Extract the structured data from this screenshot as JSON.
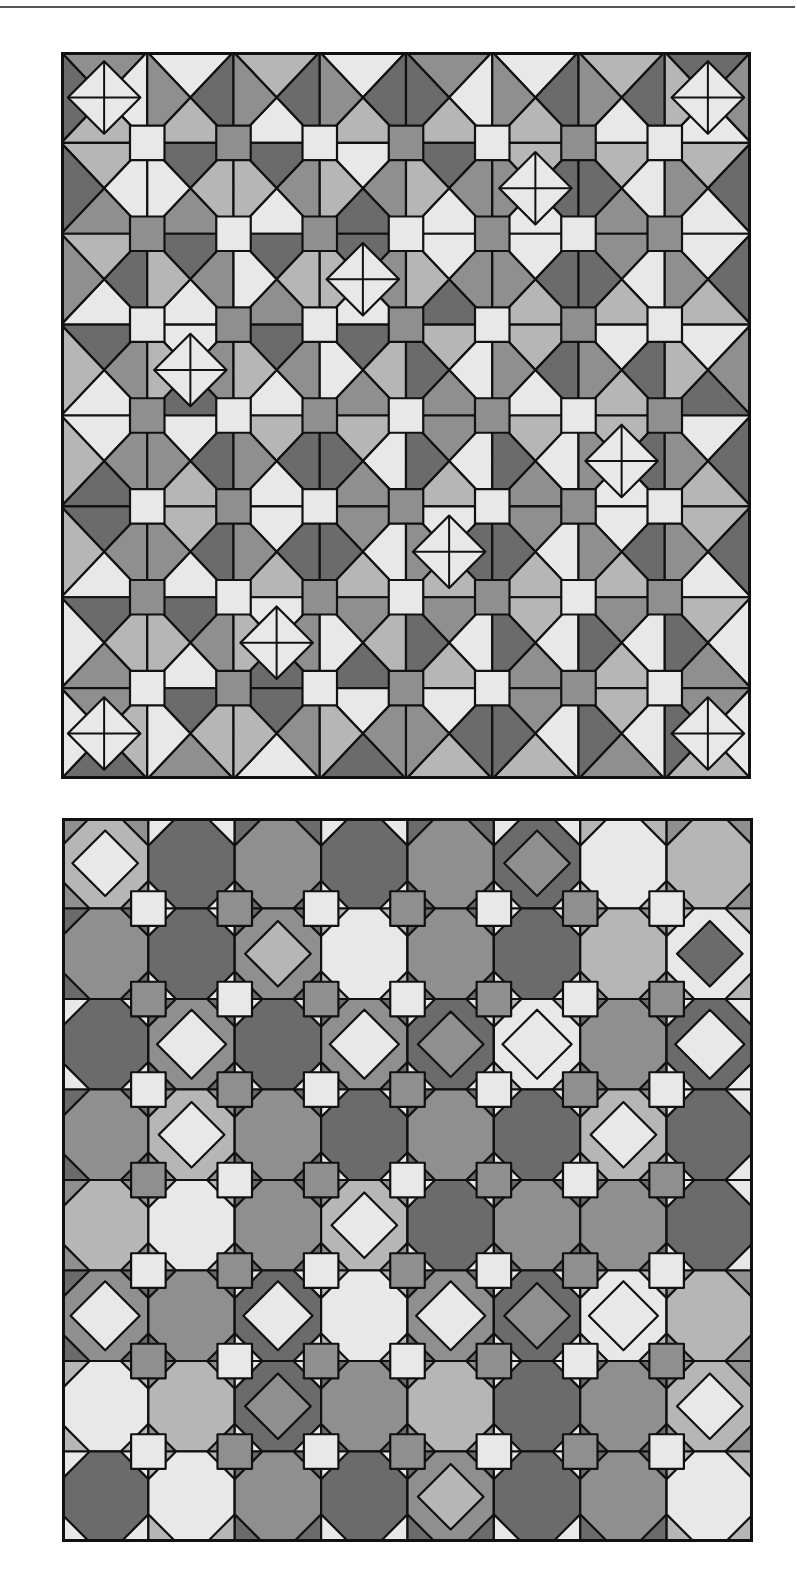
{
  "page": {
    "header_rule": true
  },
  "palette": {
    "light": "#e8e8e8",
    "midlight": "#b6b6b6",
    "mid": "#8f8f8f",
    "dark": "#6b6b6b",
    "line": "#111111"
  },
  "figures": [
    {
      "id": "top",
      "description": "Star-and-kite tessellation, 8 by 8 grid with small squares at cell corners",
      "cols": 8,
      "rows": 8,
      "motif": "star",
      "tones": [
        [
          "mid",
          "dark",
          "midlight",
          "dark",
          "mid",
          "dark",
          "midlight",
          "mid"
        ],
        [
          "light",
          "dark",
          "mid",
          "light",
          "mid",
          "midlight",
          "light",
          "midlight"
        ],
        [
          "midlight",
          "mid",
          "dark",
          "mid",
          "light",
          "dark",
          "mid",
          "dark"
        ],
        [
          "mid",
          "light",
          "mid",
          "dark",
          "light",
          "midlight",
          "dark",
          "light"
        ],
        [
          "light",
          "dark",
          "midlight",
          "light",
          "mid",
          "light",
          "midlight",
          "dark"
        ],
        [
          "mid",
          "midlight",
          "dark",
          "mid",
          "dark",
          "mid",
          "dark",
          "midlight"
        ],
        [
          "dark",
          "mid",
          "light",
          "midlight",
          "mid",
          "light",
          "mid",
          "light"
        ],
        [
          "midlight",
          "dark",
          "mid",
          "light",
          "dark",
          "mid",
          "light",
          "mid"
        ]
      ]
    },
    {
      "id": "bottom",
      "description": "Interlocking hexagon-and-diamond tessellation, 8 by 8 grid with small squares at cell corners",
      "cols": 8,
      "rows": 8,
      "motif": "hex",
      "tones": [
        [
          "midlight",
          "dark",
          "mid",
          "dark",
          "mid",
          "dark",
          "light",
          "midlight"
        ],
        [
          "mid",
          "dark",
          "mid",
          "light",
          "mid",
          "dark",
          "midlight",
          "light"
        ],
        [
          "dark",
          "mid",
          "dark",
          "mid",
          "dark",
          "light",
          "mid",
          "dark"
        ],
        [
          "mid",
          "midlight",
          "mid",
          "dark",
          "mid",
          "dark",
          "midlight",
          "dark"
        ],
        [
          "midlight",
          "light",
          "mid",
          "midlight",
          "dark",
          "mid",
          "mid",
          "dark"
        ],
        [
          "mid",
          "mid",
          "dark",
          "light",
          "mid",
          "dark",
          "light",
          "midlight"
        ],
        [
          "light",
          "midlight",
          "dark",
          "mid",
          "midlight",
          "dark",
          "mid",
          "midlight"
        ],
        [
          "dark",
          "light",
          "mid",
          "dark",
          "mid",
          "dark",
          "mid",
          "light"
        ]
      ]
    }
  ]
}
